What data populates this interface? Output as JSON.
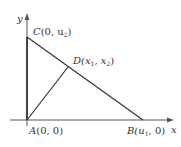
{
  "diagram": {
    "axes": {
      "x_label": "x",
      "y_label": "y"
    },
    "points": {
      "A": {
        "name": "A",
        "coords": "(0, 0)"
      },
      "B": {
        "name": "B",
        "coords_prefix": "(u",
        "coords_sub": "1",
        "coords_suffix": ", 0)"
      },
      "C": {
        "name": "C",
        "coords_prefix": "(0, u",
        "coords_sub": "2",
        "coords_suffix": ")"
      },
      "D": {
        "name": "D",
        "coords_prefix": "(x",
        "coords_sub1": "1",
        "coords_mid": ", x",
        "coords_sub2": "2",
        "coords_suffix": ")"
      }
    },
    "colors": {
      "line": "#333333",
      "axis": "#555555"
    }
  }
}
